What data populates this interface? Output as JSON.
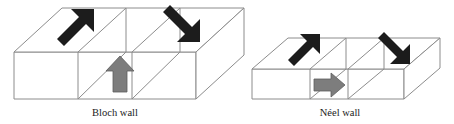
{
  "figure": {
    "background_color": "#ffffff",
    "edge_color": "#8c8c8c",
    "dark_arrow_color": "#1c1c1c",
    "gray_arrow_color": "#7d7d7d"
  },
  "panels": [
    {
      "id": "bloch",
      "caption": "Bloch wall",
      "caption_x": 115,
      "caption_y": 113,
      "block": {
        "front_left_x": 14,
        "front_right_x": 196,
        "top_front_y": 52,
        "bottom_front_y": 99,
        "depth_dx": 48,
        "depth_dy": -44,
        "divider_x": [
          78,
          132
        ]
      },
      "arrows": [
        {
          "name": "domain-arrow-left-up-right",
          "style": "dark",
          "direction": "up-right",
          "on_face": "top",
          "x": 78,
          "y": 30,
          "angle_deg": -45,
          "length": 40
        },
        {
          "name": "domain-arrow-right-down-right",
          "style": "dark",
          "direction": "down-right",
          "on_face": "top",
          "x": 185,
          "y": 30,
          "angle_deg": 45,
          "length": 40
        },
        {
          "name": "wall-arrow-out-of-plane-up",
          "style": "gray",
          "direction": "up",
          "on_face": "front",
          "x": 119,
          "y": 74,
          "angle_deg": -90,
          "length": 40
        }
      ]
    },
    {
      "id": "neel",
      "caption": "Néel wall",
      "caption_x": 340,
      "caption_y": 113,
      "block": {
        "front_left_x": 252,
        "front_right_x": 404,
        "top_front_y": 69,
        "bottom_front_y": 99,
        "depth_dx": 36,
        "depth_dy": -31,
        "divider_x": [
          310,
          348
        ]
      },
      "arrows": [
        {
          "name": "domain-arrow-left-up-right",
          "style": "dark",
          "direction": "up-right",
          "on_face": "top",
          "x": 308,
          "y": 50,
          "angle_deg": -45,
          "length": 32
        },
        {
          "name": "domain-arrow-right-down-right",
          "style": "dark",
          "direction": "down-right",
          "on_face": "top",
          "x": 398,
          "y": 50,
          "angle_deg": 45,
          "length": 32
        },
        {
          "name": "wall-arrow-in-plane-right",
          "style": "gray",
          "direction": "right",
          "on_face": "front",
          "x": 330,
          "y": 84,
          "angle_deg": 0,
          "length": 32
        }
      ]
    }
  ]
}
